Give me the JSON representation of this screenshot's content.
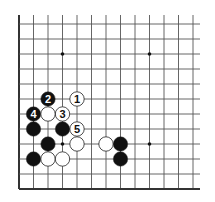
{
  "diagram": {
    "type": "go-board-fragment",
    "grid": {
      "origin_x": 19,
      "origin_y": 24,
      "spacing_x": 14.5,
      "spacing_y": 15,
      "cols": 13,
      "rows": 12,
      "line_color": "#555555",
      "edge_color": "#333333",
      "top_open": true,
      "right_open": true,
      "left_edge": true,
      "bottom_edge": true
    },
    "star_points": [
      {
        "col": 3,
        "row": 2
      },
      {
        "col": 9,
        "row": 2
      },
      {
        "col": 3,
        "row": 8
      },
      {
        "col": 9,
        "row": 8
      }
    ],
    "stones": [
      {
        "color": "white",
        "col": 4,
        "row": 5,
        "label": "1"
      },
      {
        "color": "black",
        "col": 2,
        "row": 5,
        "label": "2"
      },
      {
        "color": "white",
        "col": 3,
        "row": 6,
        "label": "3"
      },
      {
        "color": "black",
        "col": 1,
        "row": 6,
        "label": "4"
      },
      {
        "color": "white",
        "col": 4,
        "row": 7,
        "label": "5"
      },
      {
        "color": "white",
        "col": 2,
        "row": 6,
        "label": ""
      },
      {
        "color": "black",
        "col": 1,
        "row": 7,
        "label": ""
      },
      {
        "color": "black",
        "col": 3,
        "row": 7,
        "label": ""
      },
      {
        "color": "black",
        "col": 2,
        "row": 8,
        "label": ""
      },
      {
        "color": "white",
        "col": 4,
        "row": 8,
        "label": ""
      },
      {
        "color": "white",
        "col": 6,
        "row": 8,
        "label": ""
      },
      {
        "color": "black",
        "col": 7,
        "row": 8,
        "label": ""
      },
      {
        "color": "black",
        "col": 1,
        "row": 9,
        "label": ""
      },
      {
        "color": "white",
        "col": 2,
        "row": 9,
        "label": ""
      },
      {
        "color": "white",
        "col": 3,
        "row": 9,
        "label": ""
      },
      {
        "color": "black",
        "col": 7,
        "row": 9,
        "label": ""
      }
    ]
  }
}
